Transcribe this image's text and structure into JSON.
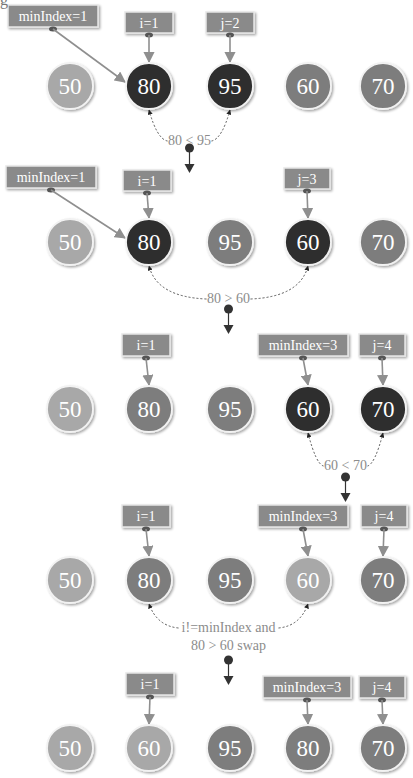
{
  "figure": {
    "corner_glyph": "g",
    "colors": {
      "light": "#a8a8a8",
      "medium": "#7d7d7d",
      "dark": "#2d2d2d",
      "label_box": "#8a8a8a",
      "label_text": "#ffffff",
      "pointer_arrow": "#8f8f8f",
      "compare_text": "#8c8c8c",
      "step_arrow": "#333333"
    },
    "positions_x": [
      70,
      149,
      230,
      308,
      383
    ],
    "rows": [
      {
        "cy": 86,
        "nodes": [
          {
            "value": "50",
            "shade": "light"
          },
          {
            "value": "80",
            "shade": "dark"
          },
          {
            "value": "95",
            "shade": "dark"
          },
          {
            "value": "60",
            "shade": "medium"
          },
          {
            "value": "70",
            "shade": "medium"
          }
        ],
        "labels": [
          {
            "text": "minIndex=1",
            "x": 8,
            "y": 5,
            "w": 90,
            "h": 22,
            "target": 1,
            "diagonal": true
          },
          {
            "text": "i=1",
            "x": 125,
            "y": 12,
            "w": 48,
            "h": 21,
            "target": 1
          },
          {
            "text": "j=2",
            "x": 206,
            "y": 12,
            "w": 48,
            "h": 21,
            "target": 2
          }
        ],
        "compare": {
          "lines": [
            "80 < 95"
          ],
          "from": 1,
          "to": 2,
          "text_y": 145,
          "pin_y": 148
        }
      },
      {
        "cy": 242,
        "nodes": [
          {
            "value": "50",
            "shade": "light"
          },
          {
            "value": "80",
            "shade": "dark"
          },
          {
            "value": "95",
            "shade": "medium"
          },
          {
            "value": "60",
            "shade": "dark"
          },
          {
            "value": "70",
            "shade": "medium"
          }
        ],
        "labels": [
          {
            "text": "minIndex=1",
            "x": 6,
            "y": 166,
            "w": 90,
            "h": 22,
            "target": 1,
            "diagonal": true
          },
          {
            "text": "i=1",
            "x": 123,
            "y": 170,
            "w": 48,
            "h": 21,
            "target": 1
          },
          {
            "text": "j=3",
            "x": 284,
            "y": 168,
            "w": 46,
            "h": 21,
            "target": 3
          }
        ],
        "compare": {
          "lines": [
            "80 > 60"
          ],
          "from": 1,
          "to": 3,
          "text_y": 303,
          "pin_y": 309
        }
      },
      {
        "cy": 409,
        "nodes": [
          {
            "value": "50",
            "shade": "light"
          },
          {
            "value": "80",
            "shade": "medium"
          },
          {
            "value": "95",
            "shade": "medium"
          },
          {
            "value": "60",
            "shade": "dark"
          },
          {
            "value": "70",
            "shade": "dark"
          }
        ],
        "labels": [
          {
            "text": "i=1",
            "x": 122,
            "y": 334,
            "w": 48,
            "h": 22,
            "target": 1
          },
          {
            "text": "minIndex=3",
            "x": 258,
            "y": 334,
            "w": 90,
            "h": 22,
            "target": 3
          },
          {
            "text": "j=4",
            "x": 359,
            "y": 334,
            "w": 46,
            "h": 22,
            "target": 4
          }
        ],
        "compare": {
          "lines": [
            "60 < 70"
          ],
          "from": 3,
          "to": 4,
          "text_y": 470,
          "pin_y": 477
        }
      },
      {
        "cy": 580,
        "nodes": [
          {
            "value": "50",
            "shade": "light"
          },
          {
            "value": "80",
            "shade": "medium"
          },
          {
            "value": "95",
            "shade": "medium"
          },
          {
            "value": "60",
            "shade": "light"
          },
          {
            "value": "70",
            "shade": "medium"
          }
        ],
        "labels": [
          {
            "text": "i=1",
            "x": 122,
            "y": 505,
            "w": 48,
            "h": 22,
            "target": 1
          },
          {
            "text": "minIndex=3",
            "x": 258,
            "y": 505,
            "w": 90,
            "h": 22,
            "target": 3
          },
          {
            "text": "j=4",
            "x": 361,
            "y": 505,
            "w": 46,
            "h": 22,
            "target": 4
          }
        ],
        "compare": {
          "lines": [
            "i!=minIndex and",
            "80 > 60 swap"
          ],
          "from": 1,
          "to": 3,
          "text_y": 632,
          "pin_y": 660
        }
      },
      {
        "cy": 748,
        "nodes": [
          {
            "value": "50",
            "shade": "light"
          },
          {
            "value": "60",
            "shade": "light"
          },
          {
            "value": "95",
            "shade": "medium"
          },
          {
            "value": "80",
            "shade": "medium"
          },
          {
            "value": "70",
            "shade": "medium"
          }
        ],
        "labels": [
          {
            "text": "i=1",
            "x": 126,
            "y": 673,
            "w": 48,
            "h": 22,
            "target": 1
          },
          {
            "text": "minIndex=3",
            "x": 263,
            "y": 676,
            "w": 88,
            "h": 22,
            "target": 3
          },
          {
            "text": "j=4",
            "x": 359,
            "y": 676,
            "w": 46,
            "h": 22,
            "target": 4
          }
        ],
        "compare": null
      }
    ]
  }
}
